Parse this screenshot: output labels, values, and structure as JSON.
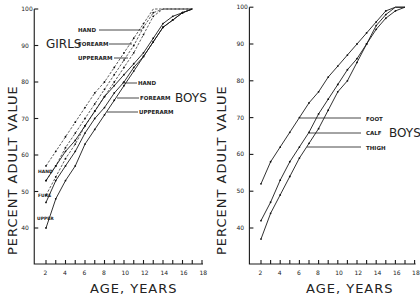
{
  "chart_data": [
    {
      "type": "line",
      "title": "",
      "xlabel": "AGE, YEARS",
      "ylabel": "PERCENT ADULT VALUE",
      "xlim": [
        1,
        18
      ],
      "ylim": [
        30,
        100
      ],
      "xticks": [
        2,
        4,
        6,
        8,
        10,
        12,
        14,
        16,
        18
      ],
      "yticks": [
        40,
        50,
        60,
        70,
        80,
        90,
        100
      ],
      "grid": false,
      "group_labels": [
        "GIRLS",
        "BOYS"
      ],
      "start_labels": [
        "HAND",
        "FORE",
        "UPPER"
      ],
      "series": [
        {
          "name": "Girls HAND",
          "style": "dashed",
          "x": [
            2,
            3,
            4,
            5,
            6,
            7,
            8,
            9,
            10,
            11,
            12,
            13,
            14,
            15,
            16,
            17
          ],
          "values": [
            57,
            61,
            65,
            69,
            73,
            77,
            80,
            84,
            88,
            92,
            96,
            100,
            100,
            100,
            100,
            100
          ]
        },
        {
          "name": "Girls FOREARM",
          "style": "dashed",
          "x": [
            2,
            3,
            4,
            5,
            6,
            7,
            8,
            9,
            10,
            11,
            12,
            13,
            14,
            15,
            16,
            17
          ],
          "values": [
            53,
            57,
            62,
            66,
            70,
            74,
            78,
            82,
            86,
            90,
            95,
            99,
            100,
            100,
            100,
            100
          ]
        },
        {
          "name": "Girls UPPERARM",
          "style": "dashed",
          "x": [
            2,
            3,
            4,
            5,
            6,
            7,
            8,
            9,
            10,
            11,
            12,
            13,
            14,
            15,
            16,
            17
          ],
          "values": [
            49,
            54,
            59,
            63,
            68,
            72,
            76,
            80,
            84,
            88,
            93,
            98,
            100,
            100,
            100,
            100
          ]
        },
        {
          "name": "Boys HAND",
          "style": "solid",
          "x": [
            2,
            3,
            4,
            5,
            6,
            7,
            8,
            9,
            10,
            11,
            12,
            13,
            14,
            15,
            16,
            17
          ],
          "values": [
            53,
            57,
            61,
            64,
            68,
            72,
            76,
            79,
            82,
            85,
            88,
            92,
            96,
            98,
            99,
            100
          ]
        },
        {
          "name": "Boys FOREARM",
          "style": "solid",
          "x": [
            2,
            3,
            4,
            5,
            6,
            7,
            8,
            9,
            10,
            11,
            12,
            13,
            14,
            15,
            16,
            17
          ],
          "values": [
            47,
            53,
            57,
            61,
            66,
            70,
            73,
            77,
            80,
            84,
            87,
            91,
            95,
            97,
            99,
            100
          ]
        },
        {
          "name": "Boys UPPERARM",
          "style": "solid",
          "x": [
            2,
            3,
            4,
            5,
            6,
            7,
            8,
            9,
            10,
            11,
            12,
            13,
            14,
            15,
            16,
            17
          ],
          "values": [
            40,
            48,
            53,
            57,
            63,
            67,
            71,
            75,
            79,
            83,
            87,
            91,
            95,
            97,
            99,
            100
          ]
        }
      ],
      "annotations": [
        {
          "text": "HAND",
          "group": "GIRLS",
          "points_to": [
            13.0,
            94
          ]
        },
        {
          "text": "FOREARM",
          "group": "GIRLS",
          "points_to": [
            12.4,
            90
          ]
        },
        {
          "text": "UPPERARM",
          "group": "GIRLS",
          "points_to": [
            12.0,
            86
          ]
        },
        {
          "text": "HAND",
          "group": "BOYS",
          "points_to": [
            9.0,
            79
          ]
        },
        {
          "text": "FOREARM",
          "group": "BOYS",
          "points_to": [
            9.5,
            75
          ]
        },
        {
          "text": "UPPERARM",
          "group": "BOYS",
          "points_to": [
            9.0,
            71
          ]
        }
      ]
    },
    {
      "type": "line",
      "title": "",
      "xlabel": "AGE, YEARS",
      "ylabel": "PERCENT ADULT VALUE",
      "xlim": [
        1,
        18
      ],
      "ylim": [
        30,
        100
      ],
      "xticks": [
        2,
        4,
        6,
        8,
        10,
        12,
        14,
        16,
        18
      ],
      "yticks": [
        40,
        50,
        60,
        70,
        80,
        90,
        100
      ],
      "grid": false,
      "group_labels": [
        "BOYS"
      ],
      "series": [
        {
          "name": "FOOT",
          "style": "solid",
          "x": [
            2,
            3,
            4,
            5,
            6,
            7,
            8,
            9,
            10,
            11,
            12,
            13,
            14,
            15,
            16,
            17
          ],
          "values": [
            52,
            58,
            62,
            66,
            70,
            74,
            77,
            81,
            84,
            87,
            90,
            93,
            96,
            99,
            100,
            100
          ]
        },
        {
          "name": "CALF",
          "style": "solid",
          "x": [
            2,
            3,
            4,
            5,
            6,
            7,
            8,
            9,
            10,
            11,
            12,
            13,
            14,
            15,
            16,
            17
          ],
          "values": [
            42,
            47,
            53,
            58,
            62,
            66,
            71,
            75,
            79,
            83,
            86,
            90,
            95,
            98,
            100,
            100
          ]
        },
        {
          "name": "THIGH",
          "style": "solid",
          "x": [
            2,
            3,
            4,
            5,
            6,
            7,
            8,
            9,
            10,
            11,
            12,
            13,
            14,
            15,
            16,
            17
          ],
          "values": [
            37,
            44,
            49,
            54,
            59,
            63,
            67,
            72,
            77,
            80,
            85,
            90,
            94,
            97,
            99,
            100
          ]
        }
      ],
      "annotations": [
        {
          "text": "FOOT",
          "points_to": [
            6.5,
            70
          ]
        },
        {
          "text": "CALF",
          "points_to": [
            7.5,
            66
          ]
        },
        {
          "text": "THIGH",
          "points_to": [
            7.5,
            62
          ]
        }
      ]
    }
  ],
  "left": {
    "ylabel": "PERCENT ADULT VALUE",
    "xlabel": "AGE, YEARS",
    "girls_label": "GIRLS",
    "boys_label": "BOYS",
    "girls_hand": "HAND",
    "girls_forearm": "FOREARM",
    "girls_upperarm": "UPPERARM",
    "boys_hand": "HAND",
    "boys_forearm": "FOREARM",
    "boys_upperarm": "UPPERARM",
    "start_hand": "HAND",
    "start_fore": "FURE",
    "start_upper": "UPPER"
  },
  "right": {
    "ylabel": "PERCENT ADULT VALUE",
    "xlabel": "AGE, YEARS",
    "boys_label": "BOYS",
    "foot": "FOOT",
    "calf": "CALF",
    "thigh": "THIGH"
  }
}
